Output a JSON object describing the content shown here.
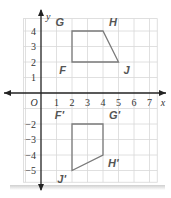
{
  "chart_data": {
    "type": "coordinate-grid",
    "title": "",
    "xlabel": "x",
    "ylabel": "y",
    "origin_label": "O",
    "xlim": [
      -1,
      7.5
    ],
    "ylim": [
      -5.5,
      4.8
    ],
    "grid": true,
    "x_ticks": [
      1,
      2,
      3,
      4,
      5,
      6,
      7
    ],
    "y_ticks": [
      4,
      3,
      2,
      1,
      -2,
      -3,
      -4,
      -5
    ],
    "polygons": [
      {
        "name": "FGHJ",
        "vertices": [
          {
            "label": "G",
            "x": 2,
            "y": 4,
            "label_pos": "top-left"
          },
          {
            "label": "H",
            "x": 4,
            "y": 4,
            "label_pos": "top-right"
          },
          {
            "label": "J",
            "x": 5,
            "y": 2,
            "label_pos": "bottom-right"
          },
          {
            "label": "F",
            "x": 2,
            "y": 2,
            "label_pos": "bottom-left"
          }
        ]
      },
      {
        "name": "F'G'H'J'",
        "vertices": [
          {
            "label": "F'",
            "x": 2,
            "y": -2,
            "label_pos": "top-left"
          },
          {
            "label": "G'",
            "x": 4,
            "y": -2,
            "label_pos": "top-right"
          },
          {
            "label": "H'",
            "x": 4,
            "y": -4,
            "label_pos": "bottom-right"
          },
          {
            "label": "J'",
            "x": 2,
            "y": -5,
            "label_pos": "bottom-left"
          }
        ]
      }
    ]
  },
  "colors": {
    "grid": "#d8d8d8",
    "axis": "#222222",
    "polygon": "#7a7a7a",
    "label": "#555555"
  }
}
